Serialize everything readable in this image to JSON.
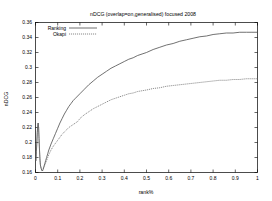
{
  "chart_data": {
    "type": "line",
    "title": "nDCG (overlap=on,generalised) focused 2008",
    "xlabel": "rank%",
    "ylabel": "nDCG",
    "xlim": [
      0,
      1
    ],
    "ylim": [
      0.16,
      0.36
    ],
    "grid": false,
    "legend_position": "top-left",
    "xticks": [
      "0",
      "0.1",
      "0.2",
      "0.3",
      "0.4",
      "0.5",
      "0.6",
      "0.7",
      "0.8",
      "0.9",
      "1"
    ],
    "xtick_values": [
      0,
      0.1,
      0.2,
      0.3,
      0.4,
      0.5,
      0.6,
      0.7,
      0.8,
      0.9,
      1
    ],
    "yticks": [
      "0.16",
      "0.18",
      "0.2",
      "0.22",
      "0.24",
      "0.26",
      "0.28",
      "0.3",
      "0.32",
      "0.34",
      "0.36"
    ],
    "ytick_values": [
      0.16,
      0.18,
      0.2,
      0.22,
      0.24,
      0.26,
      0.28,
      0.3,
      0.32,
      0.34,
      0.36
    ],
    "series": [
      {
        "name": "Ranking",
        "style": "solid",
        "color": "#4d4d4d",
        "x": [
          0.002,
          0.004,
          0.006,
          0.008,
          0.01,
          0.012,
          0.014,
          0.016,
          0.018,
          0.02,
          0.022,
          0.025,
          0.028,
          0.031,
          0.034,
          0.038,
          0.042,
          0.046,
          0.05,
          0.055,
          0.06,
          0.07,
          0.08,
          0.09,
          0.1,
          0.11,
          0.12,
          0.13,
          0.14,
          0.15,
          0.16,
          0.17,
          0.18,
          0.19,
          0.2,
          0.22,
          0.24,
          0.26,
          0.28,
          0.3,
          0.32,
          0.34,
          0.36,
          0.38,
          0.4,
          0.42,
          0.44,
          0.46,
          0.48,
          0.5,
          0.53,
          0.56,
          0.59,
          0.62,
          0.65,
          0.68,
          0.71,
          0.74,
          0.77,
          0.8,
          0.83,
          0.86,
          0.89,
          0.92,
          0.95,
          0.975,
          1.0
        ],
        "y": [
          0.176,
          0.188,
          0.2,
          0.213,
          0.222,
          0.226,
          0.22,
          0.205,
          0.19,
          0.178,
          0.17,
          0.166,
          0.163,
          0.162,
          0.164,
          0.168,
          0.172,
          0.176,
          0.18,
          0.185,
          0.19,
          0.198,
          0.205,
          0.212,
          0.219,
          0.226,
          0.232,
          0.238,
          0.243,
          0.248,
          0.252,
          0.256,
          0.259,
          0.262,
          0.265,
          0.271,
          0.277,
          0.282,
          0.287,
          0.291,
          0.295,
          0.299,
          0.302,
          0.305,
          0.308,
          0.311,
          0.313,
          0.316,
          0.318,
          0.32,
          0.324,
          0.327,
          0.33,
          0.332,
          0.335,
          0.337,
          0.339,
          0.341,
          0.342,
          0.344,
          0.345,
          0.346,
          0.346,
          0.347,
          0.347,
          0.347,
          0.347
        ]
      },
      {
        "name": "Okapi",
        "style": "dotted",
        "color": "#6b6b6b",
        "x": [
          0.002,
          0.004,
          0.006,
          0.008,
          0.01,
          0.012,
          0.014,
          0.016,
          0.018,
          0.02,
          0.022,
          0.025,
          0.028,
          0.031,
          0.034,
          0.038,
          0.042,
          0.046,
          0.05,
          0.055,
          0.06,
          0.07,
          0.08,
          0.09,
          0.1,
          0.11,
          0.12,
          0.13,
          0.14,
          0.15,
          0.16,
          0.17,
          0.18,
          0.19,
          0.2,
          0.22,
          0.24,
          0.26,
          0.28,
          0.3,
          0.32,
          0.34,
          0.36,
          0.38,
          0.4,
          0.42,
          0.44,
          0.46,
          0.48,
          0.5,
          0.53,
          0.56,
          0.59,
          0.62,
          0.65,
          0.68,
          0.71,
          0.74,
          0.77,
          0.8,
          0.83,
          0.86,
          0.89,
          0.92,
          0.95,
          0.975,
          1.0
        ],
        "y": [
          0.176,
          0.188,
          0.2,
          0.213,
          0.222,
          0.226,
          0.22,
          0.205,
          0.19,
          0.178,
          0.17,
          0.166,
          0.163,
          0.162,
          0.164,
          0.167,
          0.17,
          0.173,
          0.176,
          0.18,
          0.184,
          0.19,
          0.195,
          0.199,
          0.203,
          0.207,
          0.211,
          0.214,
          0.217,
          0.22,
          0.222,
          0.224,
          0.226,
          0.228,
          0.232,
          0.237,
          0.241,
          0.245,
          0.248,
          0.251,
          0.254,
          0.257,
          0.259,
          0.261,
          0.263,
          0.265,
          0.266,
          0.268,
          0.269,
          0.27,
          0.272,
          0.273,
          0.275,
          0.276,
          0.277,
          0.278,
          0.279,
          0.28,
          0.281,
          0.282,
          0.283,
          0.283,
          0.284,
          0.284,
          0.285,
          0.285,
          0.285
        ]
      }
    ]
  },
  "legend": {
    "entries": [
      {
        "label": "Ranking"
      },
      {
        "label": "Okapi"
      }
    ]
  }
}
